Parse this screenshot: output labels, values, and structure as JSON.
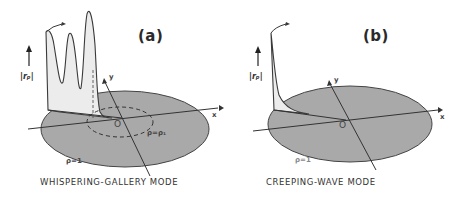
{
  "figure": {
    "panels": [
      {
        "id": "a",
        "label": "(a)",
        "caption": "WHISPERING-GALLERY MODE",
        "y_axis_label": "|rₚ|",
        "axis_x": "x",
        "axis_y": "y",
        "origin": "O",
        "boundary_label": "ρ=1",
        "inner_contour_label": "ρ=ρ₁"
      },
      {
        "id": "b",
        "label": "(b)",
        "caption": "CREEPING-WAVE MODE",
        "y_axis_label": "|rₚ|",
        "axis_x": "x",
        "axis_y": "y",
        "origin": "O",
        "boundary_label": "ρ=1"
      }
    ],
    "colors": {
      "disk_fill": "#a9a9a9",
      "line": "#3a3a3a",
      "stipple": "#e6e6e6"
    }
  }
}
